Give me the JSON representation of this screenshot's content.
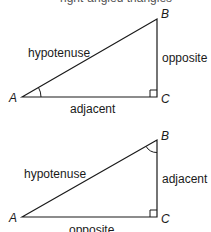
{
  "top_cut_text": "right-angled triangles",
  "triangles": [
    {
      "vertices": {
        "A": "A",
        "B": "B",
        "C": "C"
      },
      "sides": {
        "hypotenuse": "hypotenuse",
        "vertical": "opposite",
        "bottom": "adjacent"
      },
      "marked_angle": "A"
    },
    {
      "vertices": {
        "A": "A",
        "B": "B",
        "C": "C"
      },
      "sides": {
        "hypotenuse": "hypotenuse",
        "vertical": "adjacent",
        "bottom": "opposite"
      },
      "marked_angle": "B"
    }
  ],
  "colors": {
    "line": "#1a1a1a",
    "text": "#1a1a1a"
  }
}
